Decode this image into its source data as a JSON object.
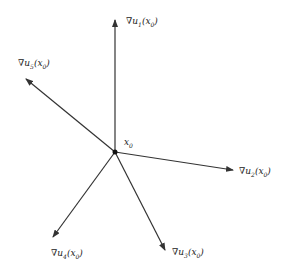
{
  "diagram": {
    "type": "vector-star",
    "stroke_color": "#333333",
    "background": "#ffffff",
    "center": {
      "x": 115,
      "y": 152,
      "label": "x",
      "label_sub": "0"
    },
    "vectors": [
      {
        "id": "u1",
        "tip": {
          "x": 115,
          "y": 20
        },
        "label_pos": {
          "x": 126,
          "y": 24
        },
        "nabla": "∇",
        "u": "u",
        "u_sub": "1",
        "arg": "x",
        "arg_sub": "0"
      },
      {
        "id": "u5",
        "tip": {
          "x": 26,
          "y": 79
        },
        "label_pos": {
          "x": 18,
          "y": 66
        },
        "nabla": "∇",
        "u": "u",
        "u_sub": "5",
        "arg": "x",
        "arg_sub": "0"
      },
      {
        "id": "u2",
        "tip": {
          "x": 233,
          "y": 170
        },
        "label_pos": {
          "x": 239,
          "y": 174
        },
        "nabla": "∇",
        "u": "u",
        "u_sub": "2",
        "arg": "x",
        "arg_sub": "0"
      },
      {
        "id": "u4",
        "tip": {
          "x": 53,
          "y": 237
        },
        "label_pos": {
          "x": 51,
          "y": 256
        },
        "nabla": "∇",
        "u": "u",
        "u_sub": "4",
        "arg": "x",
        "arg_sub": "0"
      },
      {
        "id": "u3",
        "tip": {
          "x": 165,
          "y": 250
        },
        "label_pos": {
          "x": 172,
          "y": 255
        },
        "nabla": "∇",
        "u": "u",
        "u_sub": "3",
        "arg": "x",
        "arg_sub": "0"
      }
    ]
  }
}
